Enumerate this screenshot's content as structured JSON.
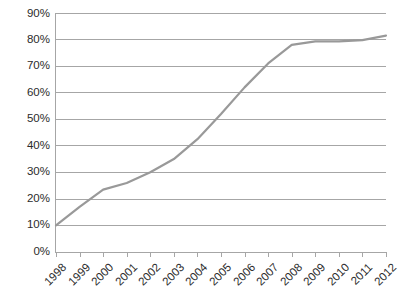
{
  "chart_data": {
    "type": "line",
    "title": "",
    "subtitle": "",
    "xlabel": "",
    "ylabel": "",
    "categories": [
      "1998",
      "1999",
      "2000",
      "2001",
      "2002",
      "2003",
      "2004",
      "2005",
      "2006",
      "2007",
      "2008",
      "2009",
      "2010",
      "2011",
      "2012"
    ],
    "values": [
      10,
      17,
      23.5,
      26,
      30,
      35,
      42.5,
      52,
      62,
      71,
      78,
      79.3,
      79.3,
      79.8,
      81.5
    ],
    "series": [
      {
        "name": "",
        "values": [
          10,
          17,
          23.5,
          26,
          30,
          35,
          42.5,
          52,
          62,
          71,
          78,
          79.3,
          79.3,
          79.8,
          81.5
        ]
      }
    ],
    "ylim": [
      0,
      90
    ],
    "ytick_values": [
      0,
      10,
      20,
      30,
      40,
      50,
      60,
      70,
      80,
      90
    ],
    "ytick_labels": [
      "0%",
      "10%",
      "20%",
      "30%",
      "40%",
      "50%",
      "60%",
      "70%",
      "80%",
      "90%"
    ],
    "xtick_labels": [
      "1998",
      "1999",
      "2000",
      "2001",
      "2002",
      "2003",
      "2004",
      "2005",
      "2006",
      "2007",
      "2008",
      "2009",
      "2010",
      "2011",
      "2012"
    ],
    "xtick_rotation": -45,
    "grid": "horizontal",
    "legend": "none",
    "line_color": "#999999",
    "grid_color": "#a6a6a6",
    "axis_color": "#a6a6a6",
    "background_color": "#ffffff",
    "text_color": "#2b2b2b"
  }
}
